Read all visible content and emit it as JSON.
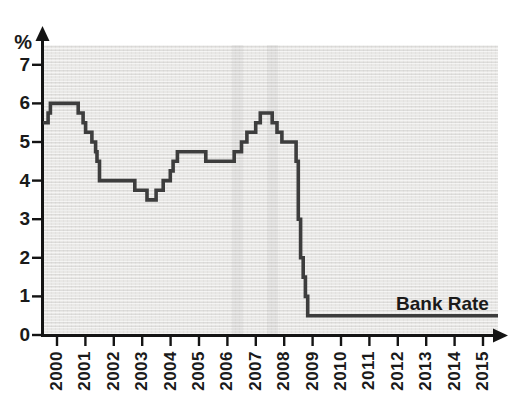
{
  "chart_data": {
    "type": "step-line",
    "title": "",
    "series_name": "Bank Rate",
    "ylabel": "%",
    "xlabel": "",
    "x_unit": "year",
    "xlim": [
      1999.5,
      2015.9
    ],
    "ylim": [
      0,
      7.5
    ],
    "grid": "fine paper texture, no gridlines",
    "legend_position": "inline annotation right of line",
    "axis_color": "#141414",
    "line_color": "#3d3d3d",
    "plot_bg_color": "#e9e8e6",
    "x_tick_labels": [
      "2000",
      "2001",
      "2002",
      "2003",
      "2004",
      "2005",
      "2006",
      "2007",
      "2008",
      "2009",
      "2010",
      "2011",
      "2012",
      "2013",
      "2014",
      "2015"
    ],
    "y_tick_labels": [
      "0",
      "1",
      "2",
      "3",
      "4",
      "5",
      "6",
      "7"
    ],
    "points": [
      [
        1999.86,
        5.5
      ],
      [
        2000.04,
        5.75
      ],
      [
        2000.12,
        6.0
      ],
      [
        2001.1,
        5.75
      ],
      [
        2001.27,
        5.5
      ],
      [
        2001.36,
        5.25
      ],
      [
        2001.58,
        5.0
      ],
      [
        2001.71,
        4.75
      ],
      [
        2001.76,
        4.5
      ],
      [
        2001.85,
        4.0
      ],
      [
        2003.09,
        3.75
      ],
      [
        2003.52,
        3.5
      ],
      [
        2003.84,
        3.75
      ],
      [
        2004.09,
        4.0
      ],
      [
        2004.34,
        4.25
      ],
      [
        2004.44,
        4.5
      ],
      [
        2004.59,
        4.75
      ],
      [
        2005.59,
        4.5
      ],
      [
        2006.59,
        4.75
      ],
      [
        2006.85,
        5.0
      ],
      [
        2007.04,
        5.25
      ],
      [
        2007.35,
        5.5
      ],
      [
        2007.51,
        5.75
      ],
      [
        2007.93,
        5.5
      ],
      [
        2008.1,
        5.25
      ],
      [
        2008.27,
        5.0
      ],
      [
        2008.77,
        4.5
      ],
      [
        2008.85,
        3.0
      ],
      [
        2008.93,
        2.0
      ],
      [
        2009.02,
        1.5
      ],
      [
        2009.1,
        1.0
      ],
      [
        2009.18,
        0.5
      ],
      [
        2015.88,
        0.5
      ]
    ]
  }
}
